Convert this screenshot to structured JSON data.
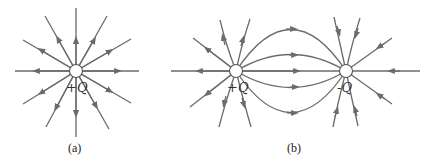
{
  "figure": {
    "panel_a": {
      "caption": "(a)",
      "charge_label": "+Q",
      "description": "Field lines radiating outward from a single positive charge"
    },
    "panel_b": {
      "caption": "(b)",
      "left_charge_label": "+Q",
      "right_charge_label": "-Q",
      "description": "Field lines from a positive charge curving to a negative charge (electric dipole)"
    }
  },
  "colors": {
    "line": "#6b6b6b",
    "charge_fill": "#ffffff",
    "background": "#ffffff"
  }
}
